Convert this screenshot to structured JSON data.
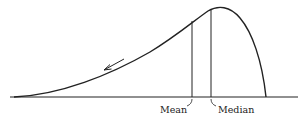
{
  "figure": {
    "type": "skewed distribution curve (negatively skewed)",
    "labels": {
      "mean": "Mean",
      "median": "Median"
    },
    "colors": {
      "ink": "#222222",
      "background": "#ffffff"
    }
  }
}
